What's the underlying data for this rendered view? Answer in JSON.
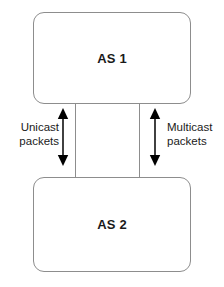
{
  "diagram": {
    "type": "block-diagram",
    "background_color": "#ffffff",
    "nodes": [
      {
        "id": "as1",
        "label": "AS 1",
        "shape": "rounded-rectangle",
        "border_color": "#8d8d8d",
        "fill_color": "#ffffff",
        "text_color": "#1a1a1a"
      },
      {
        "id": "as2",
        "label": "AS 2",
        "shape": "rounded-rectangle",
        "border_color": "#8d8d8d",
        "fill_color": "#ffffff",
        "text_color": "#1a1a1a"
      }
    ],
    "connectors": [
      {
        "id": "link-left",
        "from": "as1",
        "to": "as2",
        "style": "solid-line",
        "color": "#8d8d8d"
      },
      {
        "id": "link-right",
        "from": "as1",
        "to": "as2",
        "style": "solid-line",
        "color": "#8d8d8d"
      }
    ],
    "flows": [
      {
        "id": "unicast",
        "line1": "Unicast",
        "line2": "packets",
        "arrow": "double-headed-vertical",
        "arrow_color": "#000000",
        "label_side": "left"
      },
      {
        "id": "multicast",
        "line1": "Multicast",
        "line2": "packets",
        "arrow": "double-headed-vertical",
        "arrow_color": "#000000",
        "label_side": "right"
      }
    ]
  }
}
